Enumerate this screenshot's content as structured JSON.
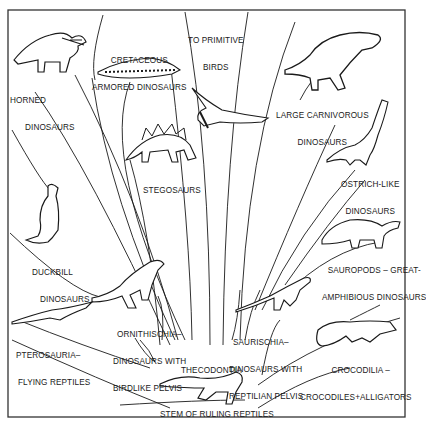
{
  "diagram": {
    "stem": {
      "label": "STEM OF RULING REPTILES"
    },
    "root_group": {
      "label": "THECODONTIA"
    },
    "branches": [
      {
        "id": "horned",
        "label_lines": [
          "HORNED",
          "DINOSAURS"
        ]
      },
      {
        "id": "cretaceous-armored",
        "label_lines": [
          "CRETACEOUS",
          "ARMORED DINOSAURS"
        ]
      },
      {
        "id": "primitive-birds",
        "label_lines": [
          "TO PRIMITIVE",
          "BIRDS"
        ]
      },
      {
        "id": "large-carnivorous",
        "label_lines": [
          "LARGE CARNIVOROUS",
          "DINOSAURS"
        ]
      },
      {
        "id": "stegosaurs",
        "label_lines": [
          "STEGOSAURS"
        ]
      },
      {
        "id": "ostrich-like",
        "label_lines": [
          "OSTRICH-LIKE",
          "DINOSAURS"
        ]
      },
      {
        "id": "duckbill",
        "label_lines": [
          "DUCKBILL",
          "DINOSAURS"
        ]
      },
      {
        "id": "sauropods",
        "label_lines": [
          "SAUROPODS – GREAT-",
          "AMPHIBIOUS DINOSAURS"
        ]
      },
      {
        "id": "ornithischia",
        "label_lines": [
          "ORNITHISCHIA–",
          "DINOSAURS WITH",
          "BIRDLIKE PELVIS"
        ]
      },
      {
        "id": "saurischia",
        "label_lines": [
          "SAURISCHIA–",
          "DINOSAURS WITH",
          "REPTILIAN PELVIS"
        ]
      },
      {
        "id": "pterosauria",
        "label_lines": [
          "PTEROSAURIA–",
          "FLYING REPTILES"
        ]
      },
      {
        "id": "crocodilia",
        "label_lines": [
          "CROCODILIA –",
          "CROCODILES+ALLIGATORS"
        ]
      }
    ],
    "colors": {
      "ink": "#1a1a1a",
      "paper": "#ffffff",
      "frame": "#333333"
    }
  }
}
